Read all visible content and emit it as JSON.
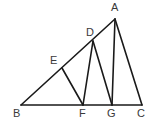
{
  "figure": {
    "background_color": "#ffffff",
    "stroke_color": "#1a1a1a",
    "label_color": "#3a3a3a",
    "canvas": {
      "width": 158,
      "height": 129
    },
    "points": [
      {
        "id": "A",
        "label": "A",
        "x": 115,
        "y": 19,
        "label_x": 111,
        "label_y": 2
      },
      {
        "id": "D",
        "label": "D",
        "x": 93,
        "y": 41,
        "label_x": 86,
        "label_y": 27
      },
      {
        "id": "E",
        "label": "E",
        "x": 62,
        "y": 68,
        "label_x": 50,
        "label_y": 55
      },
      {
        "id": "B",
        "label": "B",
        "x": 21,
        "y": 105,
        "label_x": 13,
        "label_y": 108
      },
      {
        "id": "F",
        "label": "F",
        "x": 83,
        "y": 105,
        "label_x": 79,
        "label_y": 108
      },
      {
        "id": "G",
        "label": "G",
        "x": 112,
        "y": 105,
        "label_x": 107,
        "label_y": 108
      },
      {
        "id": "C",
        "label": "C",
        "x": 142,
        "y": 105,
        "label_x": 137,
        "label_y": 108
      }
    ],
    "segments": [
      {
        "id": "BC",
        "from": "B",
        "to": "C",
        "name": "segment-bc-base"
      },
      {
        "id": "BA",
        "from": "B",
        "to": "A",
        "name": "segment-ba-hypotenuse"
      },
      {
        "id": "AC",
        "from": "A",
        "to": "C",
        "name": "segment-ac"
      },
      {
        "id": "EF",
        "from": "E",
        "to": "F",
        "name": "segment-ef"
      },
      {
        "id": "DF",
        "from": "D",
        "to": "F",
        "name": "segment-df"
      },
      {
        "id": "DG",
        "from": "D",
        "to": "G",
        "name": "segment-dg"
      },
      {
        "id": "AG",
        "from": "A",
        "to": "G",
        "name": "segment-ag"
      }
    ]
  }
}
